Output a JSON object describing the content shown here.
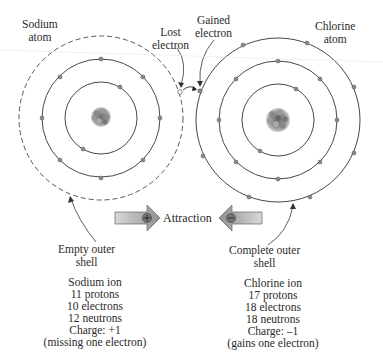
{
  "labels": {
    "sodium_atom": [
      "Sodium",
      "atom"
    ],
    "chlorine_atom": [
      "Chlorine",
      "atom"
    ],
    "lost_electron": [
      "Lost",
      "electron"
    ],
    "gained_electron": [
      "Gained",
      "electron"
    ],
    "attraction": "Attraction",
    "empty_outer_shell": [
      "Empty outer",
      "shell"
    ],
    "complete_outer_shell": [
      "Complete outer",
      "shell"
    ]
  },
  "sodium_ion": {
    "lines": [
      "Sodium ion",
      "11 protons",
      "10 electrons",
      "12 neutrons",
      "Charge: +1",
      "(missing one electron)"
    ]
  },
  "chlorine_ion": {
    "lines": [
      "Chlorine ion",
      "17 protons",
      "18 electrons",
      "18 neutrons",
      "Charge: –1",
      "(gains one electron)"
    ]
  },
  "arrow_symbols": {
    "positive": "+",
    "negative": "–"
  },
  "colors": {
    "line": "#333333",
    "electron": "#8a8a8a",
    "arrow_fill": "#a8a8a8",
    "nucleus": "#7a7a7a"
  }
}
